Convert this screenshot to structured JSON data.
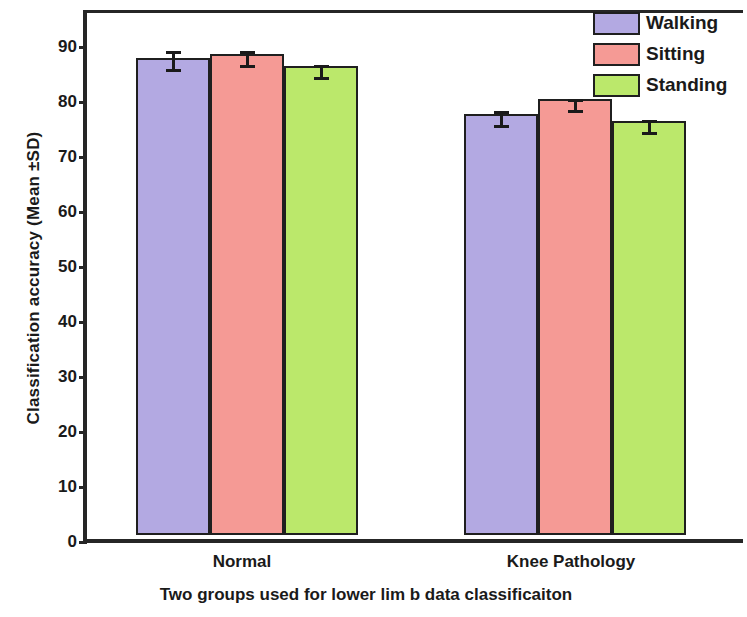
{
  "chart_data": {
    "type": "bar",
    "title": "",
    "categories": [
      "Normal",
      "Knee Pathology"
    ],
    "series": [
      {
        "name": "Walking",
        "values": [
          86.7,
          76.5
        ],
        "errors": [
          2.5,
          1.8
        ],
        "color": "#b3a9e2"
      },
      {
        "name": "Sitting",
        "values": [
          87.5,
          79.3
        ],
        "errors": [
          1.8,
          1.2
        ],
        "color": "#f59a95"
      },
      {
        "name": "Standing",
        "values": [
          85.2,
          75.2
        ],
        "errors": [
          1.5,
          1.5
        ],
        "color": "#bbe86b"
      }
    ],
    "xlabel": "Two groups used for lower lim b data classificaiton",
    "ylabel": "Classification accuracy (Mean ±SD)",
    "ylim": [
      0,
      95
    ],
    "yticks": [
      0,
      10,
      20,
      30,
      40,
      50,
      60,
      70,
      80,
      90
    ],
    "ytick_labels": [
      "0",
      "10",
      "20",
      "30",
      "40",
      "50",
      "60",
      "70",
      "80",
      "90"
    ],
    "grid": false,
    "legend_position": "top-right",
    "legend_entries": [
      "Walking",
      "Sitting",
      "Standing"
    ],
    "error_bar_style": "capped",
    "axis_color": "#262626",
    "bar_edge_color": "#1f1f1f"
  },
  "legend": {
    "items": [
      {
        "label": "Walking",
        "color": "#b3a9e2"
      },
      {
        "label": "Sitting",
        "color": "#f59a95"
      },
      {
        "label": "Standing",
        "color": "#bbe86b"
      }
    ]
  },
  "axes": {
    "y_title": "Classification accuracy (Mean ±SD)",
    "x_title": "Two groups used for lower lim b data classificaiton",
    "y_tick_labels": [
      "90",
      "80",
      "70",
      "60",
      "50",
      "40",
      "30",
      "20",
      "10",
      "0"
    ],
    "group_labels": [
      "Normal",
      "Knee Pathology"
    ]
  }
}
